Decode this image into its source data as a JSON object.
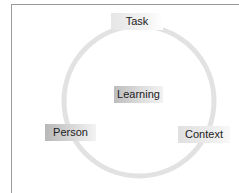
{
  "diagram": {
    "type": "cycle",
    "center": {
      "label": "Learning"
    },
    "nodes": [
      {
        "id": "task",
        "label": "Task",
        "position": "top"
      },
      {
        "id": "context",
        "label": "Context",
        "position": "bottom-right"
      },
      {
        "id": "person",
        "label": "Person",
        "position": "bottom-left"
      }
    ],
    "colors": {
      "ring": "#e0e0e0",
      "frame": "#9a9a9a",
      "text": "#222222"
    }
  }
}
